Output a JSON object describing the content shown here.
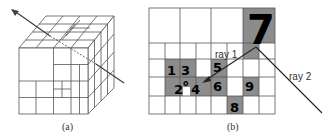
{
  "panel_a": {
    "caption": "(a)",
    "description": "Octree-subdivided cube with a ray passing through it"
  },
  "panel_b": {
    "caption": "(b)",
    "cell_labels": [
      "1",
      "3",
      "5",
      "7",
      "2",
      "o",
      "4",
      "6",
      "9",
      "8"
    ],
    "rays": [
      {
        "label": "ray 1"
      },
      {
        "label": "ray 2"
      }
    ],
    "colors": {
      "occupied": "#8c8c8c",
      "empty": "#ffffff",
      "grid": "#555555",
      "ray": "#333333"
    }
  }
}
